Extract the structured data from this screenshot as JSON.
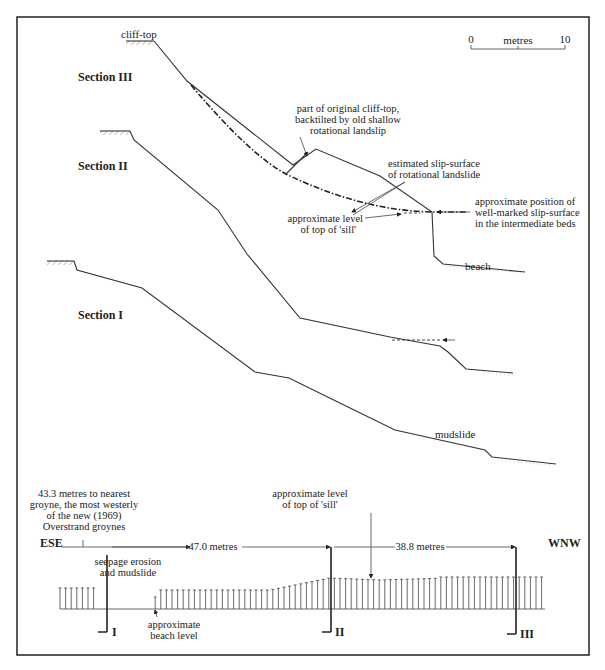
{
  "scale_bar": {
    "start": "0",
    "unit": "metres",
    "end": "10"
  },
  "sections": [
    {
      "id": "III",
      "label": "Section III",
      "top_label": "cliff-top",
      "toe_label": "beach"
    },
    {
      "id": "II",
      "label": "Section II"
    },
    {
      "id": "I",
      "label": "Section I",
      "toe_label": "mudslide"
    }
  ],
  "annotations": {
    "backtilted_1": "part of original cliff-top,",
    "backtilted_2": "backtilted by old shallow",
    "backtilted_3": "rotational landslip",
    "slip_1": "estimated slip-surface",
    "slip_2": "of rotational landslide",
    "sill_1": "approximate level",
    "sill_2": "of top of 'sill'",
    "wellmarked_1": "approximate position of",
    "wellmarked_2": "well-marked slip-surface",
    "wellmarked_3": "in the intermediate beds"
  },
  "plan": {
    "groyne_1": "43.3 metres to nearest",
    "groyne_2": "groyne, the most westerly",
    "groyne_3": "of the new (1969)",
    "groyne_4": "Overstrand groynes",
    "west_dir": "WNW",
    "east_dir": "ESE",
    "dist_1": "47.0 metres",
    "dist_2": "38.8 metres",
    "seepage_1": "seepage erosion",
    "seepage_2": "and mudslide",
    "beach_1": "approximate",
    "beach_2": "beach level",
    "sill_1": "approximate level",
    "sill_2": "of top of 'sill'",
    "marker_I": "I",
    "marker_II": "II",
    "marker_III": "III"
  }
}
